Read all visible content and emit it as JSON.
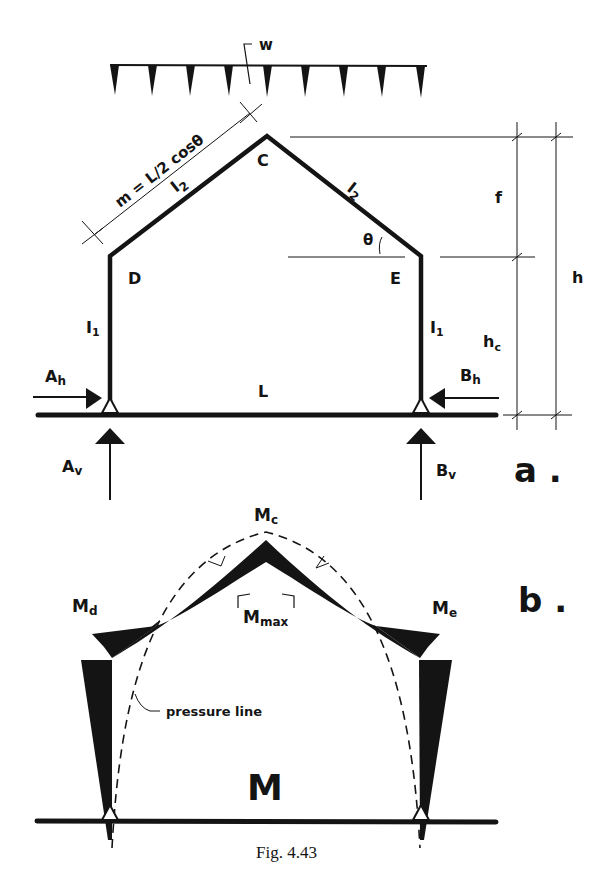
{
  "figure": {
    "caption": "Fig. 4.43",
    "part_a_label": "a .",
    "part_b_label": "b ."
  },
  "part_a": {
    "load": {
      "label": "w"
    },
    "nodes": {
      "C": "C",
      "D": "D",
      "E": "E"
    },
    "members": {
      "rafter_left": "I",
      "rafter_left_sub": "2",
      "rafter_right": "I",
      "rafter_right_sub": "2",
      "column_left": "I",
      "column_left_sub": "1",
      "column_right": "I",
      "column_right_sub": "1"
    },
    "dimensions": {
      "rafter_length": "m = L/2 cosθ",
      "rise": "f",
      "column_height": "h",
      "column_height_sub": "c",
      "total_height": "h",
      "span": "L",
      "angle": "θ"
    },
    "reactions": {
      "A_h": "A",
      "A_h_sub": "h",
      "A_v": "A",
      "A_v_sub": "v",
      "B_h": "B",
      "B_h_sub": "h",
      "B_v": "B",
      "B_v_sub": "v"
    }
  },
  "part_b": {
    "moments": {
      "Mc": "M",
      "Mc_sub": "c",
      "Md": "M",
      "Md_sub": "d",
      "Me": "M",
      "Me_sub": "e",
      "Mmax": "M",
      "Mmax_sub": "max"
    },
    "pressure_line_label": "pressure line",
    "diagram_label": "M"
  }
}
